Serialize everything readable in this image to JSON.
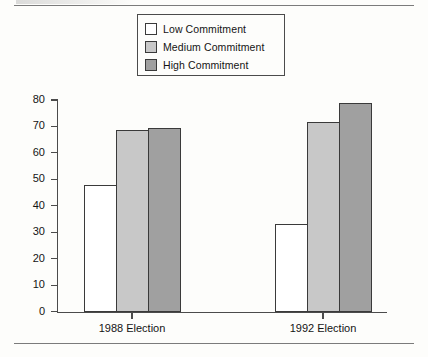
{
  "chart_data": {
    "type": "bar",
    "title": "",
    "subtitle": "",
    "xlabel": "",
    "ylabel": "",
    "categories": [
      "1988 Election",
      "1992 Election"
    ],
    "series": [
      {
        "name": "Low Commitment",
        "values": [
          48,
          33
        ],
        "color": "#ffffff"
      },
      {
        "name": "Medium Commitment",
        "values": [
          68.5,
          71.5
        ],
        "color": "#c8c8c8"
      },
      {
        "name": "High Commitment",
        "values": [
          69.5,
          79
        ],
        "color": "#a0a0a0"
      }
    ],
    "ylim": [
      0,
      80
    ],
    "ytick_values": [
      0,
      10,
      20,
      30,
      40,
      50,
      60,
      70,
      80
    ],
    "ytick_labels": [
      "0",
      "10",
      "20",
      "30",
      "40",
      "50",
      "60",
      "70",
      "80"
    ],
    "grid": false,
    "legend_position": "top-center",
    "bar_outline_color": "#3a3a3a",
    "axis_color": "#4b4b4b"
  },
  "legend": {
    "items": [
      {
        "label": "Low Commitment",
        "swatch": "#ffffff"
      },
      {
        "label": "Medium Commitment",
        "swatch": "#c8c8c8"
      },
      {
        "label": "High Commitment",
        "swatch": "#a0a0a0"
      }
    ]
  },
  "axes": {
    "y_labels": [
      "80",
      "70",
      "60",
      "50",
      "40",
      "30",
      "20",
      "10",
      "0"
    ],
    "x_labels": [
      "1988 Election",
      "1992 Election"
    ]
  }
}
